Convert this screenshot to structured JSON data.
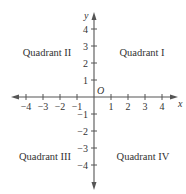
{
  "diagram": {
    "type": "coordinate-plane",
    "x_axis": {
      "label": "x",
      "ticks": [
        {
          "value": -4,
          "label": "−4"
        },
        {
          "value": -3,
          "label": "−3"
        },
        {
          "value": -2,
          "label": "−2"
        },
        {
          "value": -1,
          "label": "−1"
        },
        {
          "value": 1,
          "label": "1"
        },
        {
          "value": 2,
          "label": "2"
        },
        {
          "value": 3,
          "label": "3"
        },
        {
          "value": 4,
          "label": "4"
        }
      ]
    },
    "y_axis": {
      "label": "y",
      "ticks": [
        {
          "value": 4,
          "label": "4"
        },
        {
          "value": 3,
          "label": "3"
        },
        {
          "value": 2,
          "label": "2"
        },
        {
          "value": 1,
          "label": "1"
        },
        {
          "value": -1,
          "label": "−1"
        },
        {
          "value": -2,
          "label": "−2"
        },
        {
          "value": -3,
          "label": "−3"
        },
        {
          "value": -4,
          "label": "−4"
        }
      ]
    },
    "origin_label": "O",
    "quadrants": {
      "q1": "Quadrant I",
      "q2": "Quadrant II",
      "q3": "Quadrant III",
      "q4": "Quadrant IV"
    },
    "colors": {
      "axis": "#555555",
      "text": "#333333",
      "background": "#ffffff"
    }
  }
}
